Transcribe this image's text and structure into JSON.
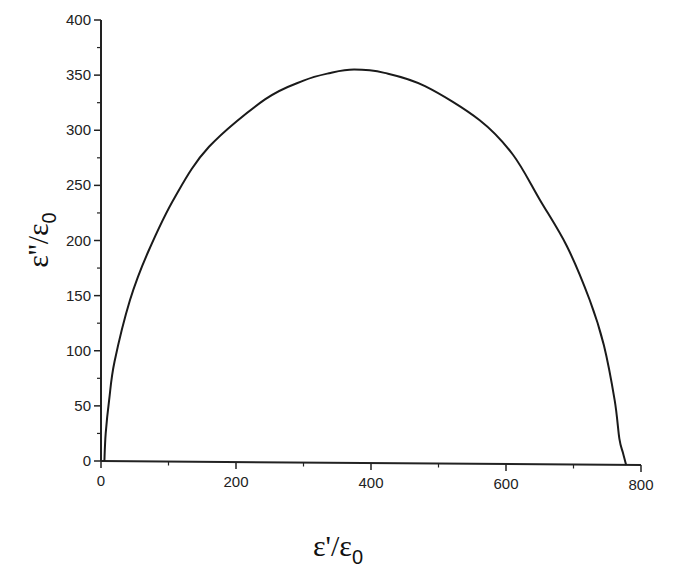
{
  "chart_data": {
    "type": "line",
    "title": "",
    "xlabel": "ε'/ε0",
    "ylabel": "ε''/ε0",
    "xlim": [
      0,
      800
    ],
    "ylim": [
      0,
      400
    ],
    "x_ticks": [
      0,
      200,
      400,
      600,
      800
    ],
    "y_ticks": [
      0,
      50,
      100,
      150,
      200,
      250,
      300,
      350,
      400
    ],
    "x_minor_step": 100,
    "y_minor_step": 25,
    "grid": false,
    "legend": null,
    "series": [
      {
        "name": "Cole-Cole plot",
        "x": [
          5,
          7,
          12,
          20,
          43,
          70,
          110,
          160,
          243,
          300,
          340,
          375,
          420,
          480,
          561,
          610,
          650,
          690,
          724,
          745,
          761,
          768,
          773,
          778
        ],
        "y": [
          0,
          25,
          55,
          90,
          146,
          190,
          240,
          285,
          328,
          345,
          352,
          355,
          352,
          340,
          309,
          278,
          237,
          195,
          146,
          105,
          55,
          20,
          8,
          0
        ]
      }
    ]
  },
  "axes": {
    "x_title_main": "ε'/ε",
    "x_title_sub": "0",
    "y_title_main": "ε''/ε",
    "y_title_sub": "0"
  },
  "colors": {
    "line": "#1a1a1a",
    "axis": "#222222",
    "background": "#ffffff"
  }
}
